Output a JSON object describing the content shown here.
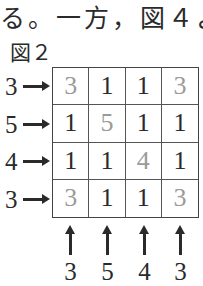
{
  "text": {
    "top_line": "る。一方，図４より",
    "figure_label": "図２"
  },
  "puzzle": {
    "row_clues": [
      "3",
      "5",
      "4",
      "3"
    ],
    "column_clues": [
      "3",
      "5",
      "4",
      "3"
    ],
    "cells": [
      [
        {
          "v": "3",
          "hint": true
        },
        {
          "v": "1",
          "hint": false
        },
        {
          "v": "1",
          "hint": false
        },
        {
          "v": "3",
          "hint": true
        }
      ],
      [
        {
          "v": "1",
          "hint": false
        },
        {
          "v": "5",
          "hint": true
        },
        {
          "v": "1",
          "hint": false
        },
        {
          "v": "1",
          "hint": false
        }
      ],
      [
        {
          "v": "1",
          "hint": false
        },
        {
          "v": "1",
          "hint": false
        },
        {
          "v": "4",
          "hint": true
        },
        {
          "v": "1",
          "hint": false
        }
      ],
      [
        {
          "v": "3",
          "hint": true
        },
        {
          "v": "1",
          "hint": false
        },
        {
          "v": "1",
          "hint": false
        },
        {
          "v": "3",
          "hint": true
        }
      ]
    ]
  },
  "colors": {
    "ink": "#2a2a2a",
    "hint_digits": "#9a9a9a",
    "grid_lines": "#444444"
  }
}
